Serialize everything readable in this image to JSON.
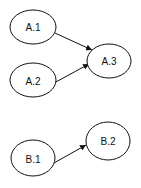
{
  "diagram": {
    "nodes": [
      {
        "id": "A.1",
        "label": "A.1",
        "cx": 33,
        "cy": 27,
        "rx": 23,
        "ry": 17
      },
      {
        "id": "A.2",
        "label": "A.2",
        "cx": 33,
        "cy": 80,
        "rx": 23,
        "ry": 17
      },
      {
        "id": "A.3",
        "label": "A.3",
        "cx": 109,
        "cy": 61,
        "rx": 22,
        "ry": 17
      },
      {
        "id": "B.1",
        "label": "B.1",
        "cx": 33,
        "cy": 158,
        "rx": 22,
        "ry": 18
      },
      {
        "id": "B.2",
        "label": "B.2",
        "cx": 108,
        "cy": 141,
        "rx": 22,
        "ry": 19
      }
    ],
    "edges": [
      {
        "from": "A.1",
        "to": "A.3"
      },
      {
        "from": "A.2",
        "to": "A.3"
      },
      {
        "from": "B.1",
        "to": "B.2"
      }
    ]
  }
}
